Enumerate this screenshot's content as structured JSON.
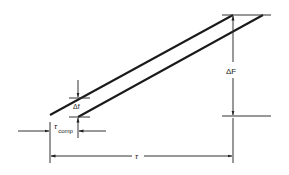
{
  "diagram": {
    "labels": {
      "delta_f_large": "ΔF",
      "delta_f_small": "Δf",
      "tau_comp_symbol": "τ",
      "tau_comp_subscript": "comp",
      "tau": "τ"
    },
    "colors": {
      "line": "#1a1a1a",
      "thin": "#333333",
      "background": "#ffffff"
    }
  }
}
